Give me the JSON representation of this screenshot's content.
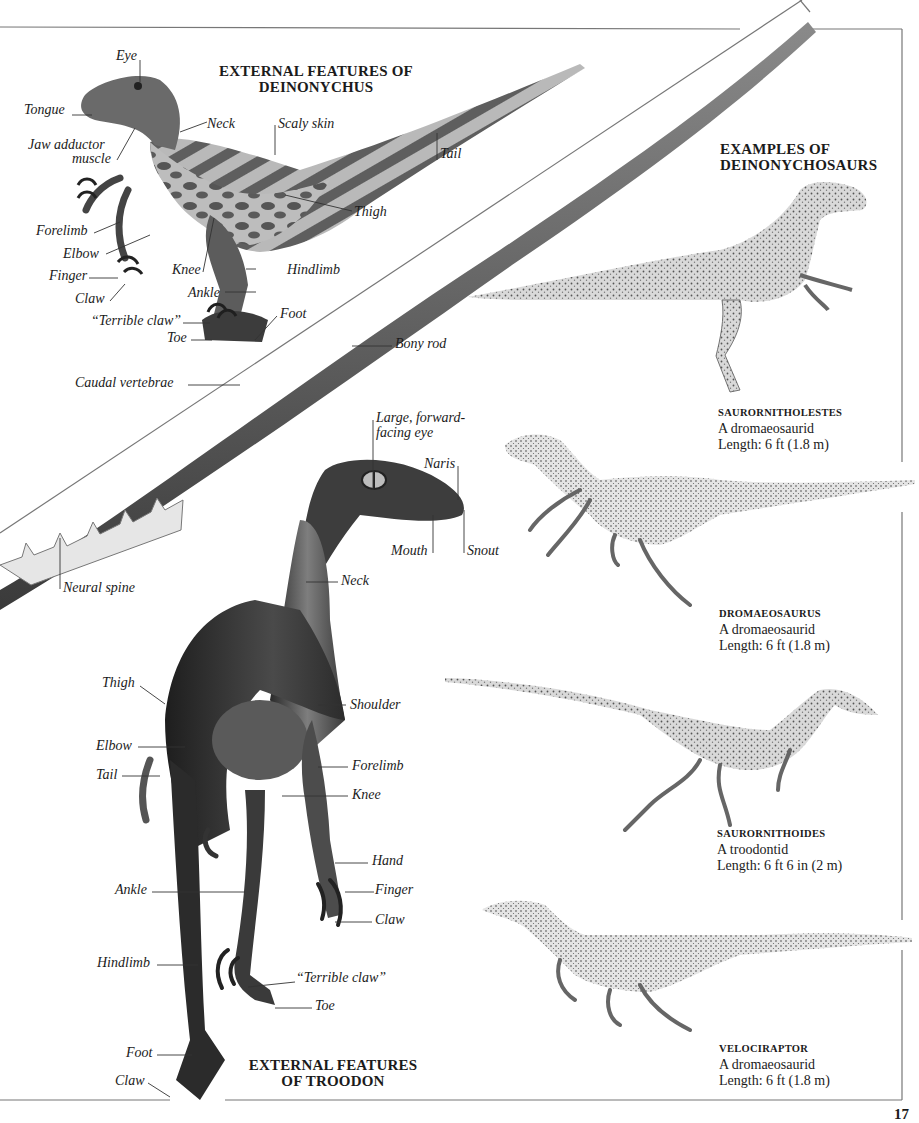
{
  "page": {
    "page_number": "17",
    "colors": {
      "background": "#ffffff",
      "frame": "#777777",
      "text": "#1b1b1b"
    }
  },
  "deinonychus": {
    "title_line1": "EXTERNAL FEATURES OF",
    "title_line2": "DEINONYCHUS",
    "labels": {
      "eye": "Eye",
      "tongue": "Tongue",
      "jaw1": "Jaw adductor",
      "jaw2": "muscle",
      "neck": "Neck",
      "scaly": "Scaly skin",
      "tail": "Tail",
      "thigh": "Thigh",
      "forelimb": "Forelimb",
      "elbow": "Elbow",
      "finger": "Finger",
      "claw": "Claw",
      "knee": "Knee",
      "hindlimb": "Hindlimb",
      "ankle": "Ankle",
      "terrible": "“Terrible claw”",
      "foot": "Foot",
      "toe": "Toe"
    }
  },
  "tail_skeleton": {
    "labels": {
      "bony_rod": "Bony rod",
      "caudal": "Caudal vertebrae",
      "neural": "Neural spine"
    }
  },
  "troodon": {
    "title_line1": "EXTERNAL FEATURES",
    "title_line2": "OF TROODON",
    "labels": {
      "eye1": "Large, forward-",
      "eye2": "facing eye",
      "naris": "Naris",
      "mouth": "Mouth",
      "snout": "Snout",
      "neck": "Neck",
      "thigh": "Thigh",
      "shoulder": "Shoulder",
      "elbow": "Elbow",
      "forelimb": "Forelimb",
      "tail": "Tail",
      "knee": "Knee",
      "hand": "Hand",
      "ankle": "Ankle",
      "finger": "Finger",
      "claw": "Claw",
      "hindlimb": "Hindlimb",
      "terrible": "“Terrible claw”",
      "toe": "Toe",
      "foot": "Foot",
      "claw2": "Claw"
    }
  },
  "examples": {
    "title_line1": "EXAMPLES OF",
    "title_line2": "DEINONYCHOSAURS",
    "items": [
      {
        "name": "SAURORNITHOLESTES",
        "family": "A dromaeosaurid",
        "length": "Length: 6 ft (1.8 m)"
      },
      {
        "name": "DROMAEOSAURUS",
        "family": "A dromaeosaurid",
        "length": "Length: 6 ft (1.8 m)"
      },
      {
        "name": "SAURORNITHOIDES",
        "family": "A troodontid",
        "length": "Length: 6 ft 6 in (2 m)"
      },
      {
        "name": "VELOCIRAPTOR",
        "family": "A dromaeosaurid",
        "length": "Length: 6 ft (1.8 m)"
      }
    ]
  }
}
